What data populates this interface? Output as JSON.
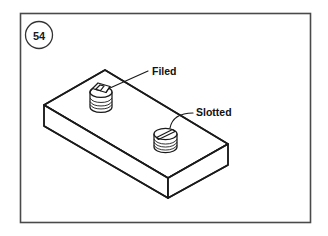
{
  "figure": {
    "number": "54",
    "badge_name": "figure-number-badge"
  },
  "callouts": [
    {
      "label": "Filed",
      "target": "screw-head-filed",
      "description": "Screw head with filed flat top"
    },
    {
      "label": "Slotted",
      "target": "screw-head-slotted",
      "description": "Screw head with slot"
    }
  ],
  "drawing": {
    "subject": "rectangular-plate-with-two-screws",
    "projection": "isometric"
  },
  "colors": {
    "line": "#1a1a1a",
    "frame": "#4a4a4a",
    "background": "#ffffff",
    "text": "#111111"
  }
}
